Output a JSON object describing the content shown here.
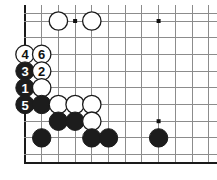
{
  "diagram": {
    "kind": "go-board-diagram",
    "board_size": 19,
    "visible_region": "bottom-left corner, rotated: shows left edge and bottom edge",
    "colors": {
      "background": "#ffffff",
      "grid_line": "#8c8c8c",
      "board_edge": "#1a1a1a",
      "black_stone": "#1c1c1c",
      "white_stone": "#ffffff",
      "star_point": "#111111"
    },
    "geometry": {
      "cell_px": 16.7,
      "origin_x": 25,
      "origin_y": 21,
      "stone_radius": 9.2,
      "star_radius": 2.0
    },
    "grid": {
      "vertical_x": [
        25,
        41.7,
        58.4,
        75.1,
        91.8,
        108.5,
        125.2,
        141.9,
        158.6,
        175.3,
        192,
        208.7
      ],
      "horizontal_y": [
        13,
        21,
        37.7,
        54.4,
        71.1,
        87.8,
        104.5,
        121.2,
        137.9,
        154.6,
        163
      ],
      "edges": [
        "left",
        "bottom"
      ]
    },
    "star_points": [
      {
        "x": 75.1,
        "y": 21,
        "name": "star-point-top"
      },
      {
        "x": 158.6,
        "y": 21,
        "name": "star-point-top-right"
      },
      {
        "x": 158.6,
        "y": 121.2,
        "name": "star-point-lower-right"
      }
    ],
    "stones": [
      {
        "id": "w-top-1",
        "color": "white",
        "x": 58.4,
        "y": 21,
        "label": ""
      },
      {
        "id": "w-top-2",
        "color": "white",
        "x": 91.8,
        "y": 21,
        "label": ""
      },
      {
        "id": "m4",
        "color": "white",
        "x": 25,
        "y": 54.4,
        "label": "4"
      },
      {
        "id": "m6",
        "color": "white",
        "x": 41.7,
        "y": 54.4,
        "label": "6"
      },
      {
        "id": "m3",
        "color": "black",
        "x": 25,
        "y": 71.1,
        "label": "3"
      },
      {
        "id": "m2",
        "color": "white",
        "x": 41.7,
        "y": 71.1,
        "label": "2"
      },
      {
        "id": "m1",
        "color": "black",
        "x": 25,
        "y": 87.8,
        "label": "1"
      },
      {
        "id": "w-a",
        "color": "white",
        "x": 41.7,
        "y": 87.8,
        "label": ""
      },
      {
        "id": "m5",
        "color": "black",
        "x": 25,
        "y": 104.5,
        "label": "5"
      },
      {
        "id": "b-a",
        "color": "black",
        "x": 41.7,
        "y": 104.5,
        "label": ""
      },
      {
        "id": "w-b",
        "color": "white",
        "x": 58.4,
        "y": 104.5,
        "label": ""
      },
      {
        "id": "w-c",
        "color": "white",
        "x": 75.1,
        "y": 104.5,
        "label": ""
      },
      {
        "id": "w-d",
        "color": "white",
        "x": 91.8,
        "y": 104.5,
        "label": ""
      },
      {
        "id": "b-b",
        "color": "black",
        "x": 58.4,
        "y": 121.2,
        "label": ""
      },
      {
        "id": "b-c",
        "color": "black",
        "x": 75.1,
        "y": 121.2,
        "label": ""
      },
      {
        "id": "w-e",
        "color": "white",
        "x": 91.8,
        "y": 121.2,
        "label": ""
      },
      {
        "id": "b-d",
        "color": "black",
        "x": 41.7,
        "y": 137.9,
        "label": ""
      },
      {
        "id": "b-e",
        "color": "black",
        "x": 91.8,
        "y": 137.9,
        "label": ""
      },
      {
        "id": "b-f",
        "color": "black",
        "x": 108.5,
        "y": 137.9,
        "label": ""
      },
      {
        "id": "b-g",
        "color": "black",
        "x": 158.6,
        "y": 137.9,
        "label": ""
      }
    ],
    "move_sequence": [
      {
        "number": "1",
        "color": "black"
      },
      {
        "number": "2",
        "color": "white"
      },
      {
        "number": "3",
        "color": "black"
      },
      {
        "number": "4",
        "color": "white"
      },
      {
        "number": "5",
        "color": "black"
      },
      {
        "number": "6",
        "color": "white"
      }
    ]
  }
}
